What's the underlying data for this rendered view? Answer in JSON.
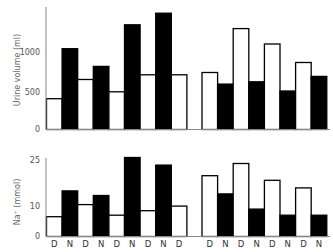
{
  "chart_data": [
    {
      "type": "bar",
      "title": "",
      "xlabel": "",
      "ylabel": "Urine volume (ml)",
      "ylim": [
        0,
        1600
      ],
      "yticks": [
        0,
        500,
        1000
      ],
      "grid": false,
      "legend": "none (D = open bars, N = filled bars)",
      "categories": [
        "D",
        "N",
        "D",
        "N",
        "D",
        "N",
        "D",
        "N",
        "D",
        "D",
        "N",
        "D",
        "N",
        "D",
        "N",
        "D",
        "N"
      ],
      "groups": [
        {
          "name": "left",
          "labels": [
            "D",
            "N",
            "D",
            "N",
            "D",
            "N",
            "D",
            "N",
            "D"
          ],
          "values": [
            400,
            1050,
            650,
            820,
            490,
            1360,
            710,
            1510,
            710
          ]
        },
        {
          "name": "right",
          "labels": [
            "D",
            "N",
            "D",
            "N",
            "D",
            "N",
            "D",
            "N"
          ],
          "values": [
            740,
            590,
            1310,
            620,
            1110,
            500,
            870,
            690
          ]
        }
      ],
      "series": [
        {
          "name": "D",
          "fill": "#ffffff"
        },
        {
          "name": "N",
          "fill": "#000000"
        }
      ]
    },
    {
      "type": "bar",
      "title": "",
      "xlabel": "",
      "ylabel": "Na+ (mmol)",
      "ylim": [
        0,
        27
      ],
      "yticks": [
        0,
        10,
        25
      ],
      "grid": false,
      "legend": "none (D = open bars, N = filled bars)",
      "categories": [
        "D",
        "N",
        "D",
        "N",
        "D",
        "N",
        "D",
        "N",
        "D",
        "D",
        "N",
        "D",
        "N",
        "D",
        "N",
        "D",
        "N"
      ],
      "groups": [
        {
          "name": "left",
          "labels": [
            "D",
            "N",
            "D",
            "N",
            "D",
            "N",
            "D",
            "N",
            "D"
          ],
          "values": [
            6.5,
            15,
            10.5,
            13.5,
            7,
            26,
            8.5,
            23.5,
            10
          ]
        },
        {
          "name": "right",
          "labels": [
            "D",
            "N",
            "D",
            "N",
            "D",
            "N",
            "D",
            "N"
          ],
          "values": [
            20,
            14,
            24,
            9,
            18.5,
            7,
            16,
            7
          ]
        }
      ],
      "series": [
        {
          "name": "D",
          "fill": "#ffffff"
        },
        {
          "name": "N",
          "fill": "#000000"
        }
      ]
    }
  ],
  "labels": {
    "top_ylabel": "Urine volume (ml)",
    "bottom_ylabel": "Na⁺ (mmol)",
    "top_ticks": [
      "0",
      "500",
      "1000"
    ],
    "bottom_ticks": [
      "0",
      "10",
      "25"
    ]
  },
  "colors": {
    "filled": "#000000",
    "open": "#ffffff",
    "axis": "#777777"
  }
}
